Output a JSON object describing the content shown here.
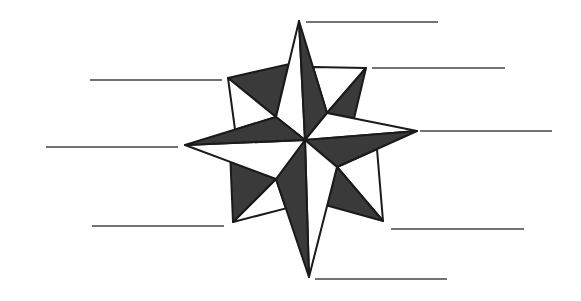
{
  "diagram": {
    "type": "compass-rose-worksheet",
    "colors": {
      "background": "#ffffff",
      "outline": "#1a1a1a",
      "dark_fill": "#3a3a3a",
      "light_fill": "#ffffff",
      "label_line": "#444444"
    },
    "center": [
      305,
      140
    ],
    "cardinal_points": {
      "N": [
        299,
        21
      ],
      "E": [
        417,
        131
      ],
      "S": [
        309,
        277
      ],
      "W": [
        185,
        145
      ]
    },
    "intercardinal_points": {
      "NE": [
        366,
        68
      ],
      "SE": [
        383,
        221
      ],
      "SW": [
        233,
        222
      ],
      "NW": [
        228,
        78
      ]
    },
    "inner_vertices": {
      "NE": [
        327,
        113
      ],
      "SE": [
        337,
        167
      ],
      "SW": [
        276,
        179
      ],
      "NW": [
        276,
        117
      ]
    },
    "label_lines": [
      {
        "id": "north",
        "x1": 306,
        "x2": 438,
        "y": 22,
        "label": ""
      },
      {
        "id": "northeast",
        "x1": 372,
        "x2": 505,
        "y": 68,
        "label": ""
      },
      {
        "id": "east",
        "x1": 420,
        "x2": 552,
        "y": 131,
        "label": ""
      },
      {
        "id": "southeast",
        "x1": 391,
        "x2": 524,
        "y": 229,
        "label": ""
      },
      {
        "id": "south",
        "x1": 315,
        "x2": 447,
        "y": 279,
        "label": ""
      },
      {
        "id": "southwest",
        "x1": 92,
        "x2": 224,
        "y": 226,
        "label": ""
      },
      {
        "id": "west",
        "x1": 46,
        "x2": 178,
        "y": 147,
        "label": ""
      },
      {
        "id": "northwest",
        "x1": 90,
        "x2": 222,
        "y": 80,
        "label": ""
      }
    ]
  }
}
